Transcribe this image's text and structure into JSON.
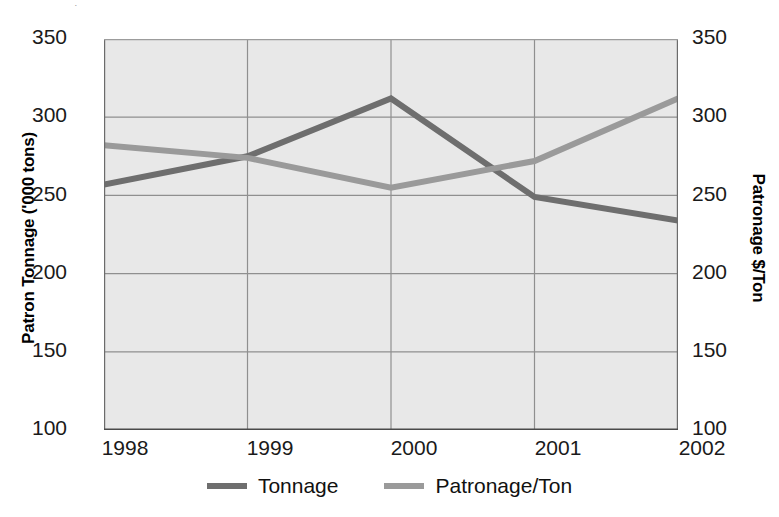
{
  "chart_data": {
    "type": "line",
    "title": "",
    "subtitle": "",
    "xlabel": "",
    "ylabel": "Patron Tonnage ('000 tons)",
    "y2label": "Patronage $/Ton",
    "categories": [
      "1998",
      "1999",
      "2000",
      "2001",
      "2002"
    ],
    "x": [
      1998,
      1999,
      2000,
      2001,
      2002
    ],
    "ylim": [
      100,
      350
    ],
    "y2lim": [
      100,
      350
    ],
    "yticks": [
      "350",
      "300",
      "250",
      "200",
      "150",
      "100"
    ],
    "y2ticks": [
      "350",
      "300",
      "250",
      "200",
      "150",
      "100"
    ],
    "ytick_values": [
      350,
      300,
      250,
      200,
      150,
      100
    ],
    "grid": true,
    "legend_position": "bottom",
    "series": [
      {
        "name": "Tonnage",
        "axis": "left",
        "color": "#6e6e6e",
        "values": [
          257,
          275,
          312,
          249,
          234
        ]
      },
      {
        "name": "Patronage/Ton",
        "axis": "right",
        "color": "#9a9a9a",
        "values": [
          282,
          274,
          255,
          272,
          312
        ]
      }
    ]
  },
  "axes": {
    "left_title": "Patron Tonnage ('000 tons)",
    "right_title": "Patronage $/Ton"
  },
  "legend": {
    "items": [
      {
        "label": "Tonnage",
        "color": "#6e6e6e"
      },
      {
        "label": "Patronage/Ton",
        "color": "#9a9a9a"
      }
    ]
  },
  "colors": {
    "plot_background": "#e8e8e8",
    "gridline": "#8f8f8f",
    "tonnage_line": "#6e6e6e",
    "patronage_line": "#9a9a9a",
    "text": "#000000"
  },
  "artifact": {
    "top_fragment": "."
  }
}
